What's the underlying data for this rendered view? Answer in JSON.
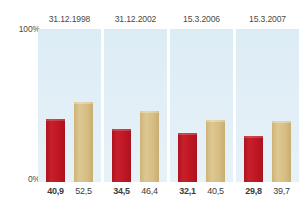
{
  "chart_data": {
    "type": "bar",
    "title": "",
    "xlabel": "",
    "ylabel": "",
    "ylim": [
      0,
      100
    ],
    "grid": false,
    "legend": "none",
    "axis_ticks": [
      "100%",
      "0%"
    ],
    "categories": [
      "31.12.1998",
      "31.12.2002",
      "15.3.2006",
      "15.3.2007"
    ],
    "series": [
      {
        "name": "red",
        "color": "#bf1622",
        "values": [
          40.9,
          34.5,
          32.1,
          29.8
        ],
        "labels": [
          "40,9",
          "34,5",
          "32,1",
          "29,8"
        ]
      },
      {
        "name": "tan",
        "color": "#d5bd83",
        "values": [
          52.5,
          46.4,
          40.5,
          39.7
        ],
        "labels": [
          "52,5",
          "46,4",
          "40,5",
          "39,7"
        ]
      }
    ]
  },
  "axis": {
    "top_label": "100%",
    "bottom_label": "0%"
  },
  "panels": [
    {
      "header": "31.12.1998",
      "red_value": 40.9,
      "tan_value": 52.5,
      "red_label": "40,9",
      "tan_label": "52,5"
    },
    {
      "header": "31.12.2002",
      "red_value": 34.5,
      "tan_value": 46.4,
      "red_label": "34,5",
      "tan_label": "46,4"
    },
    {
      "header": "15.3.2006",
      "red_value": 32.1,
      "tan_value": 40.5,
      "red_label": "32,1",
      "tan_label": "40,5"
    },
    {
      "header": "15.3.2007",
      "red_value": 29.8,
      "tan_value": 39.7,
      "red_label": "29,8",
      "tan_label": "39,7"
    }
  ],
  "colors": {
    "red": "#bf1622",
    "tan": "#d5bd83",
    "panel_background": "#dfedf5",
    "text": "#3c3c3b"
  }
}
